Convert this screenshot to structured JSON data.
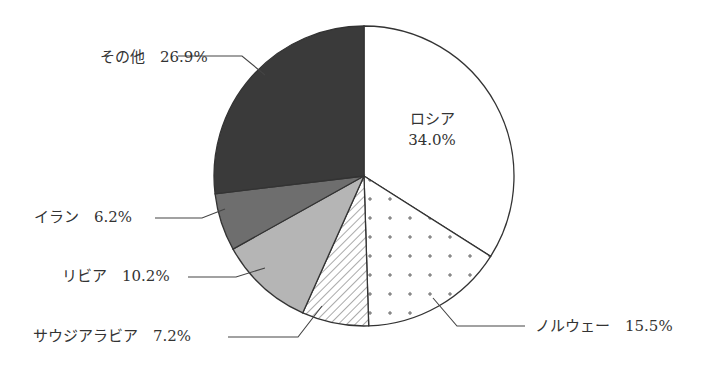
{
  "chart_data": {
    "type": "pie",
    "title": "",
    "start_angle_deg": 0,
    "direction": "clockwise",
    "slices": [
      {
        "label": "ロシア",
        "value": 34.0,
        "text": "34.0%",
        "fill": "white"
      },
      {
        "label": "ノルウェー",
        "value": 15.5,
        "text": "15.5%",
        "fill": "plus-dots"
      },
      {
        "label": "サウジアラビア",
        "value": 7.2,
        "text": "7.2%",
        "fill": "hatch"
      },
      {
        "label": "リビア",
        "value": 10.2,
        "text": "10.2%",
        "fill": "light-gray"
      },
      {
        "label": "イラン",
        "value": 6.2,
        "text": "6.2%",
        "fill": "mid-gray"
      },
      {
        "label": "その他",
        "value": 26.9,
        "text": "26.9%",
        "fill": "dark-gray"
      }
    ],
    "colors": {
      "outline": "#333333",
      "light-gray": "#b5b5b5",
      "mid-gray": "#6e6e6e",
      "dark-gray": "#3a3a3a"
    }
  },
  "labels": {
    "russia_name": "ロシア",
    "russia_value": "34.0%",
    "norway": "ノルウェー　15.5%",
    "saudi": "サウジアラビア　7.2%",
    "libya": "リビア　10.2%",
    "iran": "イラン　6.2%",
    "other": "その他　26.9%"
  }
}
